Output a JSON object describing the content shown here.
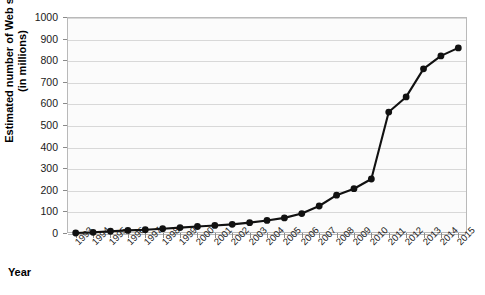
{
  "chart_data": {
    "type": "line",
    "title": "",
    "xlabel": "Year",
    "ylabel": "Estimated number of Web sites (in millions)",
    "ylabel_line1": "Estimated number of Web sites",
    "ylabel_line2": "(in millions)",
    "categories": [
      "1993",
      "1994",
      "1995",
      "1996",
      "1997",
      "1998",
      "1999",
      "2000",
      "2001",
      "2002",
      "2003",
      "2004",
      "2005",
      "2006",
      "2007",
      "2008",
      "2009",
      "2010",
      "2011",
      "2012",
      "2013",
      "2014",
      "2015"
    ],
    "values": [
      0,
      3,
      8,
      12,
      15,
      20,
      25,
      30,
      35,
      40,
      48,
      58,
      70,
      90,
      125,
      175,
      205,
      250,
      560,
      630,
      760,
      820,
      857
    ],
    "x": [
      1993,
      1994,
      1995,
      1996,
      1997,
      1998,
      1999,
      2000,
      2001,
      2002,
      2003,
      2004,
      2005,
      2006,
      2007,
      2008,
      2009,
      2010,
      2011,
      2012,
      2013,
      2014,
      2015
    ],
    "ylim": [
      0,
      1000
    ],
    "y_ticks": [
      0,
      100,
      200,
      300,
      400,
      500,
      600,
      700,
      800,
      900,
      1000
    ],
    "y_tick_labels": [
      "0",
      "100",
      "200",
      "300",
      "400",
      "500",
      "600",
      "700",
      "800",
      "900",
      "1000"
    ],
    "grid": true,
    "legend": false,
    "legend_position": "none",
    "series": [
      {
        "name": "Estimated number of Web sites",
        "values": [
          0,
          3,
          8,
          12,
          15,
          20,
          25,
          30,
          35,
          40,
          48,
          58,
          70,
          90,
          125,
          175,
          205,
          250,
          560,
          630,
          760,
          820,
          857
        ]
      }
    ],
    "marker": "circle",
    "marker_color": "#111111",
    "line_color": "#111111",
    "plot_background": "#fbfbfb",
    "grid_color": "#d8d8d8",
    "axis_color": "#b9b9b9"
  }
}
